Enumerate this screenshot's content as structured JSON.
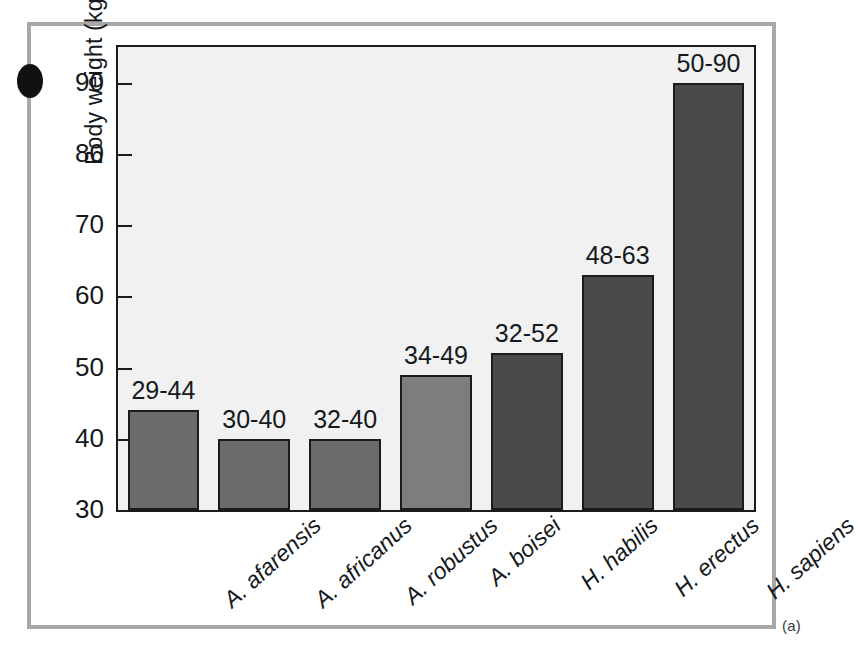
{
  "figure": {
    "panel_letter": "(a)",
    "bullet_marker": "dot-marker"
  },
  "chart_data": {
    "type": "bar",
    "title": "",
    "xlabel": "",
    "ylabel": "Body weight (kg)",
    "ylim": [
      30,
      95
    ],
    "yticks": [
      30,
      40,
      50,
      60,
      70,
      80,
      90
    ],
    "ytick_labels": [
      "30",
      "40",
      "50",
      "60",
      "70",
      "80",
      "90"
    ],
    "grid": false,
    "legend": "none",
    "categories": [
      "A. afarensis",
      "A. africanus",
      "A. robustus",
      "A. boisei",
      "H. habilis",
      "H. erectus",
      "H. sapiens"
    ],
    "values": [
      44,
      40,
      40,
      49,
      52,
      63,
      90
    ],
    "range_min": [
      29,
      30,
      32,
      34,
      32,
      48,
      50
    ],
    "range_max": [
      44,
      40,
      40,
      49,
      52,
      63,
      90
    ],
    "data_labels": [
      "29-44",
      "30-40",
      "32-40",
      "34-49",
      "32-52",
      "48-63",
      "50-90"
    ],
    "bar_colors": [
      "#6b6b6b",
      "#6b6b6b",
      "#6b6b6b",
      "#7d7d7d",
      "#4a4a4a",
      "#4a4a4a",
      "#4a4a4a"
    ],
    "series": [
      {
        "name": "Body weight range (kg)",
        "values": [
          44,
          40,
          40,
          49,
          52,
          63,
          90
        ]
      }
    ]
  },
  "colors": {
    "plot_background": "#f1f1f1",
    "axis_line": "#1b1b1b",
    "outer_frame": "#a8a8a8",
    "page_background": "#ffffff",
    "bar_light": "#6b6b6b",
    "bar_mid": "#7d7d7d",
    "bar_dark": "#4a4a4a",
    "text": "#15191c"
  }
}
